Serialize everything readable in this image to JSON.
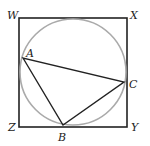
{
  "figure": {
    "square": {
      "x": 19,
      "y": 18,
      "size": 108,
      "stroke": "#222222",
      "vertices": {
        "W": "W",
        "X": "X",
        "Y": "Y",
        "Z": "Z"
      }
    },
    "circle": {
      "cx": 73,
      "cy": 72,
      "r": 53,
      "stroke": "#aaaaaa"
    },
    "triangle": {
      "stroke": "#222222",
      "vertices": {
        "A": "A",
        "B": "B",
        "C": "C"
      }
    },
    "labels": {
      "W": "W",
      "X": "X",
      "Y": "Y",
      "Z": "Z",
      "A": "A",
      "B": "B",
      "C": "C"
    }
  }
}
